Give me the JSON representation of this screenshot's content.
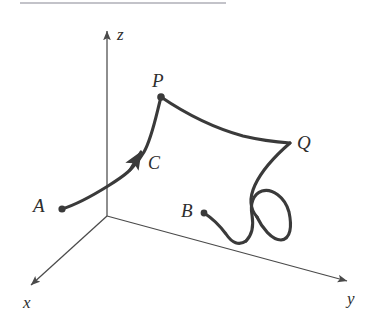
{
  "figure": {
    "kind": "3d-space-curve-diagram",
    "background_color": "#ffffff",
    "stroke_color": "#3a3a3a",
    "axis_color": "#4a4a4a",
    "label_color": "#2e2e2e",
    "top_rule_color": "#b9b9bf",
    "width": 374,
    "height": 331
  },
  "axes": {
    "origin": {
      "x": 107,
      "y": 216
    },
    "z": {
      "label": "z",
      "label_x": 117,
      "label_y": 26,
      "from": {
        "x": 107,
        "y": 216
      },
      "to": {
        "x": 107,
        "y": 28
      }
    },
    "x": {
      "label": "x",
      "label_x": 23,
      "label_y": 294,
      "from": {
        "x": 107,
        "y": 216
      },
      "to": {
        "x": 27,
        "y": 288
      }
    },
    "y": {
      "label": "y",
      "label_x": 347,
      "label_y": 290,
      "from": {
        "x": 107,
        "y": 216
      },
      "to": {
        "x": 352,
        "y": 283
      }
    }
  },
  "points": [
    {
      "name": "A",
      "label": "A",
      "label_x": 33,
      "label_y": 196,
      "dot_x": 62,
      "dot_y": 209,
      "dot_r": 3.6
    },
    {
      "name": "P",
      "label": "P",
      "label_x": 152,
      "label_y": 71,
      "dot_x": 161,
      "dot_y": 97,
      "dot_r": 3.8
    },
    {
      "name": "Q",
      "label": "Q",
      "label_x": 297,
      "label_y": 133,
      "dot_x": 290,
      "dot_y": 143,
      "dot_r": 0
    },
    {
      "name": "B",
      "label": "B",
      "label_x": 181,
      "label_y": 201,
      "dot_x": 204,
      "dot_y": 213,
      "dot_r": 3.4
    }
  ],
  "curve": {
    "name": "C",
    "label": "C",
    "label_x": 148,
    "label_y": 154,
    "stroke_width": 3.1,
    "direction_arrow": {
      "x": 138,
      "y": 157,
      "angle_deg": -56
    },
    "description": "Oriented space curve C running from A up through P, across to Q, down and around a loop, ending at B"
  },
  "top_rule": {
    "x": 20,
    "y": 2,
    "width": 206,
    "height": 2
  }
}
